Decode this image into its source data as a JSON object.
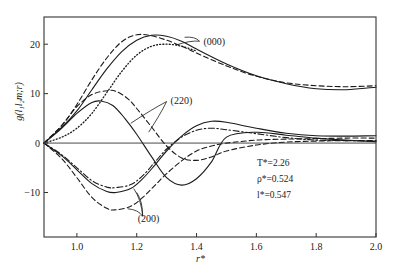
{
  "chart_data": {
    "type": "line",
    "title": "",
    "xlabel": "r*",
    "ylabel": "g(l1 l2 m; r)",
    "ylabel_display": "g(l₁l₂m;r)",
    "xlim": [
      0.89,
      2.0
    ],
    "ylim": [
      -19,
      25.5
    ],
    "grid": false,
    "x_ticks": [
      1.0,
      1.2,
      1.4,
      1.6,
      1.8,
      2.0
    ],
    "x_tick_labels": [
      "1.0",
      "1.2",
      "1.4",
      "1.6",
      "1.8",
      "2.0"
    ],
    "y_ticks": [
      20,
      10,
      0,
      -10
    ],
    "y_tick_labels": [
      "20",
      "10",
      "0",
      "−10"
    ],
    "zero_line": true,
    "annotations": [
      {
        "text": "(000)",
        "x": 1.42,
        "y": 20.5
      },
      {
        "text": "(220)",
        "x": 1.31,
        "y": 8.6
      },
      {
        "text": "(200)",
        "x": 1.2,
        "y": -15.2
      }
    ],
    "parameters": [
      {
        "label": "T*",
        "value": "2.26",
        "text": "T*=2.26"
      },
      {
        "label": "ρ*",
        "value": "0.524",
        "text": "ρ*=0.524"
      },
      {
        "label": "l*",
        "value": "0.547",
        "text": "l*=0.547"
      }
    ],
    "series": [
      {
        "name": "(000) solid",
        "group": "000",
        "style": "solid",
        "x": [
          0.89,
          0.95,
          1.0,
          1.05,
          1.1,
          1.15,
          1.2,
          1.25,
          1.3,
          1.35,
          1.4,
          1.5,
          1.6,
          1.7,
          1.8,
          1.9,
          2.0
        ],
        "y": [
          0,
          3.2,
          6.5,
          10.8,
          15.0,
          18.5,
          20.8,
          21.8,
          21.6,
          20.6,
          19.0,
          16.0,
          13.6,
          12.0,
          11.0,
          10.8,
          11.3
        ]
      },
      {
        "name": "(000) dashed",
        "group": "000",
        "style": "dashed",
        "x": [
          0.89,
          0.95,
          1.0,
          1.05,
          1.1,
          1.15,
          1.2,
          1.25,
          1.3,
          1.35,
          1.4,
          1.5,
          1.6,
          1.7,
          1.8,
          1.9,
          2.0
        ],
        "y": [
          0,
          3.6,
          7.8,
          12.8,
          17.2,
          20.5,
          21.9,
          21.7,
          20.8,
          19.6,
          18.2,
          15.6,
          13.5,
          12.2,
          11.6,
          11.4,
          11.6
        ]
      },
      {
        "name": "(000) dotted",
        "group": "000",
        "style": "dotted",
        "x": [
          0.89,
          0.95,
          1.0,
          1.05,
          1.1,
          1.15,
          1.2,
          1.25,
          1.3,
          1.35,
          1.4
        ],
        "y": [
          0,
          1.2,
          3.0,
          6.0,
          10.2,
          14.5,
          17.8,
          19.6,
          20.0,
          19.6,
          18.6
        ]
      },
      {
        "name": "(220) solid",
        "group": "220",
        "style": "solid",
        "x": [
          0.89,
          0.95,
          1.0,
          1.05,
          1.08,
          1.12,
          1.16,
          1.2,
          1.25,
          1.3,
          1.35,
          1.4,
          1.45,
          1.5,
          1.6,
          1.7,
          1.8,
          1.9,
          2.0
        ],
        "y": [
          0,
          3.0,
          6.0,
          8.2,
          8.5,
          7.6,
          5.0,
          1.8,
          -2.8,
          -7.0,
          -8.5,
          -7.2,
          -3.8,
          1.2,
          2.2,
          1.6,
          1.0,
          0.6,
          0.3
        ]
      },
      {
        "name": "(220) dashed",
        "group": "220",
        "style": "dashed",
        "x": [
          0.89,
          0.95,
          1.0,
          1.05,
          1.1,
          1.13,
          1.17,
          1.2,
          1.25,
          1.3,
          1.35,
          1.4,
          1.45,
          1.5,
          1.6,
          1.7,
          1.8,
          1.9,
          2.0
        ],
        "y": [
          0,
          3.6,
          7.4,
          9.8,
          10.6,
          10.5,
          9.0,
          7.0,
          3.2,
          -0.6,
          -3.0,
          -3.5,
          -2.8,
          -1.6,
          -0.4,
          0.2,
          0.4,
          0.5,
          0.5
        ]
      },
      {
        "name": "(200) solid",
        "group": "200",
        "style": "solid",
        "x": [
          0.89,
          0.95,
          1.0,
          1.05,
          1.1,
          1.13,
          1.18,
          1.22,
          1.26,
          1.3,
          1.35,
          1.4,
          1.45,
          1.5,
          1.6,
          1.7,
          1.8,
          1.9,
          2.0
        ],
        "y": [
          0,
          -2.6,
          -5.4,
          -8.2,
          -9.8,
          -10.0,
          -9.2,
          -7.2,
          -4.5,
          -1.6,
          1.4,
          3.5,
          4.4,
          4.2,
          3.0,
          2.0,
          1.5,
          1.4,
          1.5
        ]
      },
      {
        "name": "(200) dash-dot",
        "group": "200",
        "style": "dashdot",
        "x": [
          0.89,
          0.95,
          1.0,
          1.05,
          1.1,
          1.13,
          1.18,
          1.22,
          1.26,
          1.3,
          1.35,
          1.4,
          1.45,
          1.5,
          1.6,
          1.7,
          1.8,
          1.9,
          2.0
        ],
        "y": [
          0,
          -2.4,
          -5.0,
          -7.6,
          -8.9,
          -9.0,
          -8.4,
          -6.6,
          -3.9,
          -1.2,
          1.2,
          2.6,
          3.0,
          2.7,
          1.9,
          1.1,
          0.6,
          0.5,
          0.4
        ]
      },
      {
        "name": "(200) dashed",
        "group": "200",
        "style": "dashed",
        "x": [
          0.89,
          0.95,
          1.0,
          1.05,
          1.1,
          1.13,
          1.18,
          1.22,
          1.26,
          1.3,
          1.35,
          1.4,
          1.45,
          1.5,
          1.6,
          1.7,
          1.8,
          1.9,
          2.0
        ],
        "y": [
          0,
          -3.2,
          -7.0,
          -11.0,
          -13.2,
          -13.5,
          -12.8,
          -11.0,
          -8.6,
          -6.2,
          -3.6,
          -1.6,
          -0.6,
          0.0,
          0.6,
          0.8,
          0.9,
          1.0,
          1.0
        ]
      }
    ]
  },
  "axes": {
    "y_label": "g(l₁l₂m;r)",
    "x_label": "r*"
  }
}
